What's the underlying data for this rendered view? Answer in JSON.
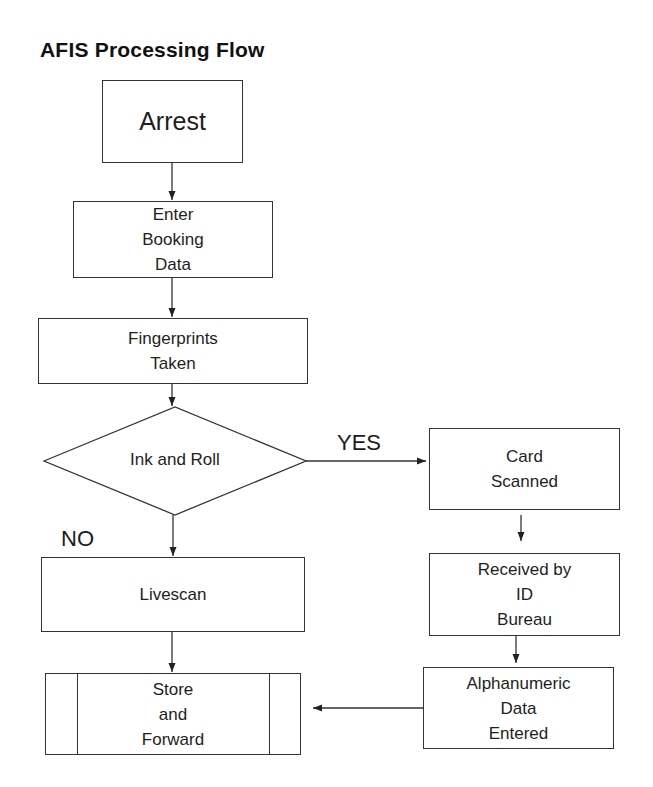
{
  "title": "AFIS Processing Flow",
  "nodes": {
    "arrest": {
      "label": "Arrest",
      "shape": "process"
    },
    "enter_booking": {
      "label": "Enter\nBooking\nData",
      "shape": "process"
    },
    "fingerprints": {
      "label": "Fingerprints\nTaken",
      "shape": "process"
    },
    "ink_roll": {
      "label": "Ink and Roll",
      "shape": "decision"
    },
    "card_scanned": {
      "label": "Card\nScanned",
      "shape": "process"
    },
    "received": {
      "label": "Received by\nID\nBureau",
      "shape": "process"
    },
    "livescan": {
      "label": "Livescan",
      "shape": "process"
    },
    "store_forward": {
      "label": "Store\nand\nForward",
      "shape": "predefined-process"
    },
    "alphanumeric": {
      "label": "Alphanumeric\nData\nEntered",
      "shape": "process"
    }
  },
  "edge_labels": {
    "yes": "YES",
    "no": "NO"
  },
  "edges": [
    {
      "from": "Arrest",
      "to": "Enter Booking Data"
    },
    {
      "from": "Enter Booking Data",
      "to": "Fingerprints Taken"
    },
    {
      "from": "Fingerprints Taken",
      "to": "Ink and Roll"
    },
    {
      "from": "Ink and Roll",
      "to": "Card Scanned",
      "label": "YES"
    },
    {
      "from": "Ink and Roll",
      "to": "Livescan",
      "label": "NO"
    },
    {
      "from": "Card Scanned",
      "to": "Received by ID Bureau"
    },
    {
      "from": "Received by ID Bureau",
      "to": "Alphanumeric Data Entered"
    },
    {
      "from": "Livescan",
      "to": "Store and Forward"
    },
    {
      "from": "Alphanumeric Data Entered",
      "to": "Store and Forward"
    }
  ]
}
